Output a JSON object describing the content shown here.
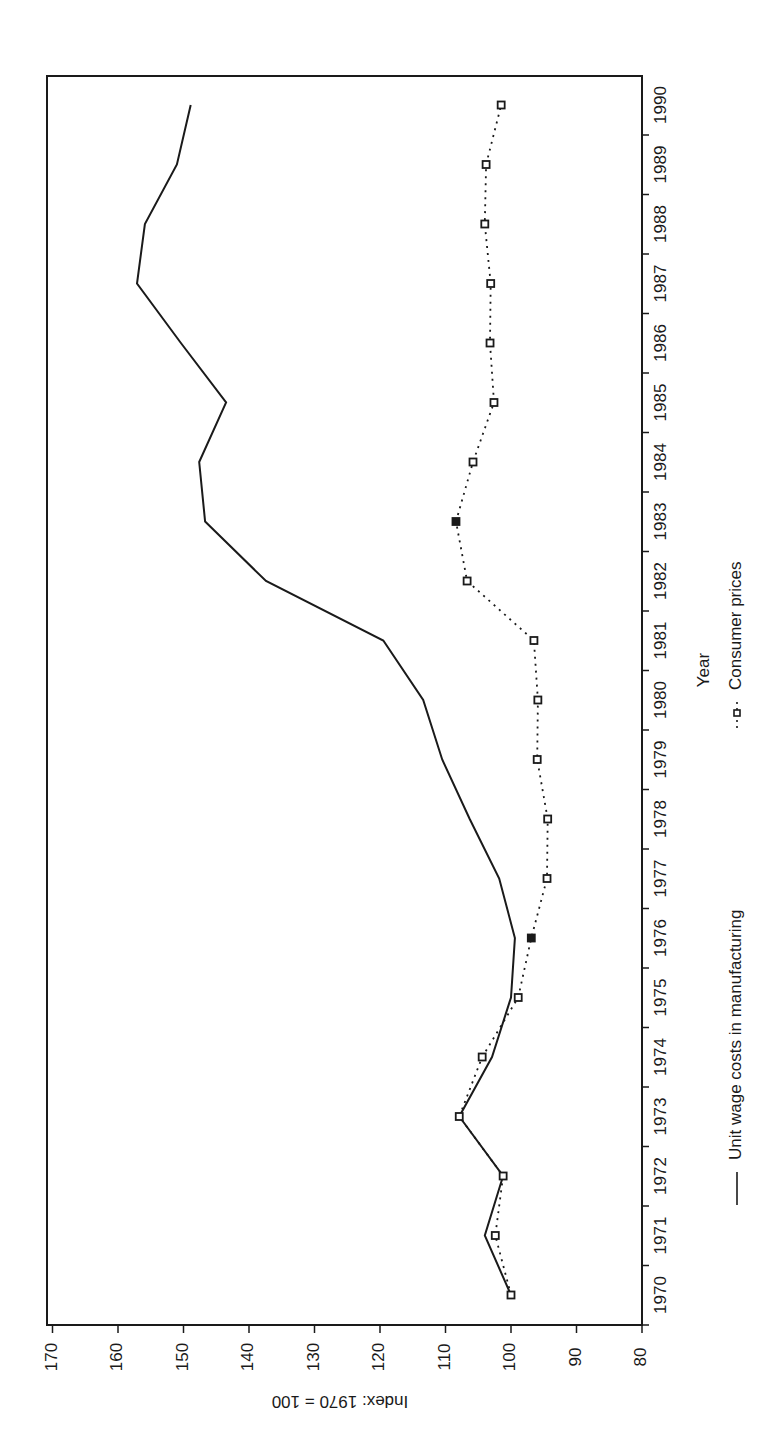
{
  "chart_data": {
    "type": "line",
    "orientation": "rotated-90-clockwise",
    "title": "",
    "xlabel": "Year",
    "ylabel": "Index: 1970 = 100",
    "x": [
      1970,
      1971,
      1972,
      1973,
      1974,
      1975,
      1976,
      1977,
      1978,
      1979,
      1980,
      1981,
      1982,
      1983,
      1984,
      1985,
      1986,
      1987,
      1988,
      1989,
      1990
    ],
    "x_tick_labels": [
      "1970",
      "1971",
      "1972",
      "1973",
      "1974",
      "1975",
      "1976",
      "1977",
      "1978",
      "1979",
      "1980",
      "1981",
      "1982",
      "1983",
      "1984",
      "1985",
      "1986",
      "1987",
      "1988",
      "1989",
      "1990"
    ],
    "ylim": [
      80,
      170
    ],
    "y_tick_labels": [
      "80",
      "90",
      "100",
      "110",
      "120",
      "130",
      "140",
      "150",
      "160",
      "170"
    ],
    "y_ticks": [
      80,
      90,
      100,
      110,
      120,
      130,
      140,
      150,
      160,
      170
    ],
    "grid": false,
    "legend_position": "bottom",
    "series": [
      {
        "name": "Unit wage costs in manufacturing",
        "style": "solid",
        "marker": "none",
        "color": "#1a1a1a",
        "values": [
          100.0,
          104.0,
          101.2,
          107.9,
          102.9,
          100.0,
          99.4,
          101.8,
          106.3,
          110.5,
          113.4,
          119.5,
          137.4,
          146.7,
          147.6,
          143.5,
          150.4,
          157.1,
          155.9,
          151.0,
          148.9
        ]
      },
      {
        "name": "Consumer prices",
        "style": "dotted",
        "marker": "square",
        "color": "#1a1a1a",
        "values": [
          100.0,
          102.4,
          101.2,
          107.9,
          104.4,
          98.9,
          96.9,
          94.5,
          94.4,
          96.0,
          95.9,
          96.5,
          106.7,
          108.4,
          105.8,
          102.6,
          103.2,
          103.1,
          104.0,
          103.8,
          101.5
        ]
      }
    ],
    "legend": [
      {
        "label": "Unit wage costs in manufacturing",
        "symbol": "solid-line"
      },
      {
        "label": "Consumer prices",
        "symbol": "dotted-line-square-marker"
      }
    ]
  }
}
